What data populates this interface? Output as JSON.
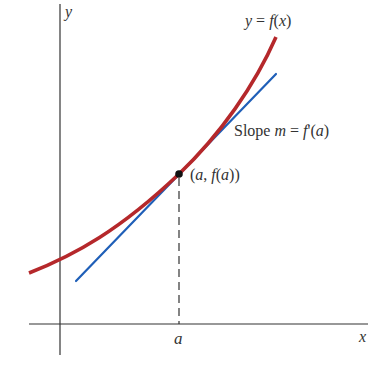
{
  "figure": {
    "axes": {
      "x_label": "x",
      "y_label": "y"
    },
    "curve": {
      "label": "y = f(x)",
      "label_parts": [
        "y",
        " = ",
        "f",
        "(",
        "x",
        ")"
      ],
      "color": "#b5282b"
    },
    "tangent": {
      "label": "Slope m = f'(a)",
      "label_parts": [
        "Slope ",
        "m",
        " = ",
        "f",
        "'(",
        "a",
        ")"
      ],
      "color": "#1f5fb8"
    },
    "point": {
      "label": "(a, f(a))",
      "label_parts": [
        "(",
        "a",
        ", ",
        "f",
        "(",
        "a",
        "))"
      ],
      "color": "#111111"
    },
    "tick": {
      "label": "a"
    },
    "axis_color": "#333333"
  }
}
